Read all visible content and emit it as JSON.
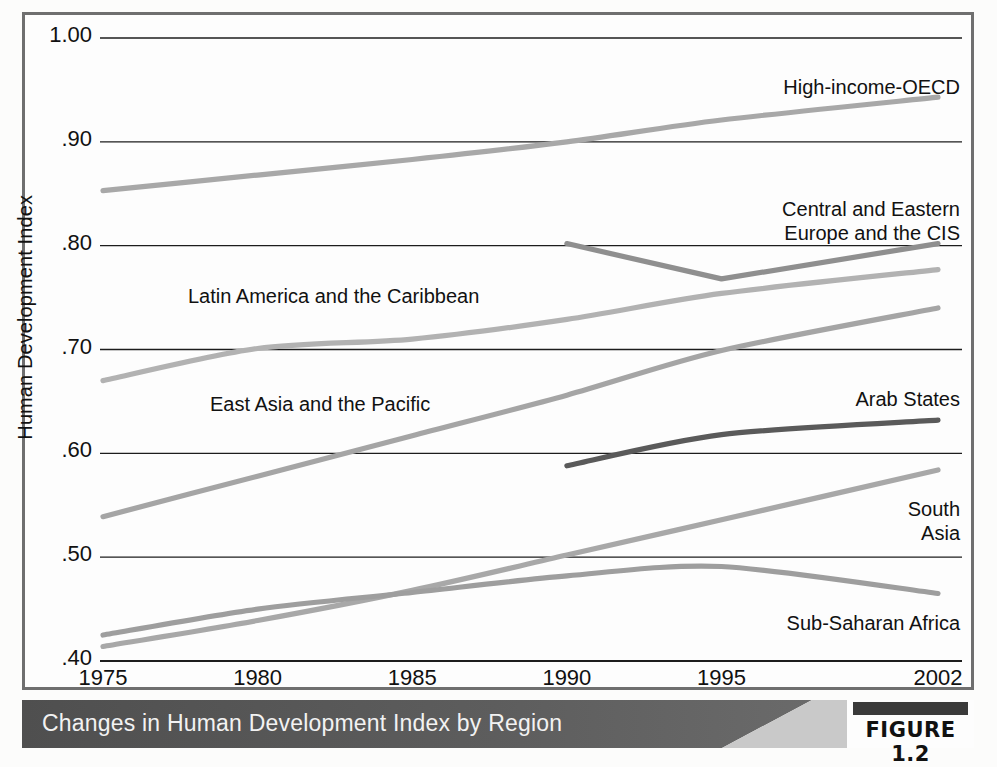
{
  "figure": {
    "caption": "Changes in Human Development Index by Region",
    "badge_label": "FIGURE 1.2"
  },
  "chart_data": {
    "type": "line",
    "title": "Changes in Human Development Index by Region",
    "xlabel": "",
    "ylabel": "Human Development Index",
    "x": [
      1975,
      1980,
      1985,
      1990,
      1995,
      2002
    ],
    "xlim": [
      1975,
      2002
    ],
    "ylim": [
      0.4,
      1.0
    ],
    "ytick_labels": [
      "1.00",
      ".90",
      ".80",
      ".70",
      ".60",
      ".50",
      ".40"
    ],
    "ytick_values": [
      1.0,
      0.9,
      0.8,
      0.7,
      0.6,
      0.5,
      0.4
    ],
    "xtick_labels": [
      "1975",
      "1980",
      "1985",
      "1990",
      "1995",
      "2002"
    ],
    "grid": "horizontal",
    "legend": "inline-labels",
    "series": [
      {
        "name": "High-income-OECD",
        "color": "#a8a8a8",
        "label_anchor": "top-right",
        "x": [
          1975,
          1980,
          1985,
          1990,
          1995,
          2002
        ],
        "values": [
          0.853,
          0.868,
          0.883,
          0.9,
          0.921,
          0.943
        ]
      },
      {
        "name": "Central and Eastern\nEurope and the CIS",
        "color": "#8f8f8f",
        "label_anchor": "right",
        "x": [
          1990,
          1995,
          2002
        ],
        "values": [
          0.802,
          0.768,
          0.802
        ]
      },
      {
        "name": "Latin America and the Caribbean",
        "color": "#b2b2b2",
        "label_anchor": "inline",
        "x": [
          1975,
          1980,
          1985,
          1990,
          1995,
          2002
        ],
        "values": [
          0.67,
          0.701,
          0.71,
          0.729,
          0.754,
          0.777
        ]
      },
      {
        "name": "East Asia and the Pacific",
        "color": "#a5a5a5",
        "label_anchor": "inline",
        "x": [
          1975,
          1980,
          1985,
          1990,
          1995,
          2002
        ],
        "values": [
          0.539,
          0.578,
          0.617,
          0.656,
          0.699,
          0.74
        ]
      },
      {
        "name": "Arab States",
        "color": "#5a5a5a",
        "label_anchor": "right",
        "x": [
          1990,
          1995,
          2002
        ],
        "values": [
          0.588,
          0.618,
          0.632
        ]
      },
      {
        "name": "South\nAsia",
        "color": "#a8a8a8",
        "label_anchor": "right",
        "x": [
          1975,
          1980,
          1985,
          1990,
          1995,
          2002
        ],
        "values": [
          0.414,
          0.439,
          0.468,
          0.502,
          0.536,
          0.584
        ]
      },
      {
        "name": "Sub-Saharan Africa",
        "color": "#9e9e9e",
        "label_anchor": "bottom-right",
        "x": [
          1975,
          1980,
          1985,
          1990,
          1995,
          2002
        ],
        "values": [
          0.425,
          0.45,
          0.466,
          0.482,
          0.491,
          0.465
        ]
      }
    ],
    "series_labels": [
      {
        "text": "High-income-OECD",
        "x": 960,
        "y": 76,
        "align": "right"
      },
      {
        "text": "Central and Eastern",
        "x": 960,
        "y": 198,
        "align": "right"
      },
      {
        "text": "Europe and the CIS",
        "x": 960,
        "y": 222,
        "align": "right"
      },
      {
        "text": "Latin America and the Caribbean",
        "x": 188,
        "y": 285,
        "align": "left"
      },
      {
        "text": "East Asia and the Pacific",
        "x": 210,
        "y": 393,
        "align": "left"
      },
      {
        "text": "Arab States",
        "x": 960,
        "y": 388,
        "align": "right"
      },
      {
        "text": "South",
        "x": 960,
        "y": 498,
        "align": "right"
      },
      {
        "text": "Asia",
        "x": 960,
        "y": 522,
        "align": "right"
      },
      {
        "text": "Sub-Saharan Africa",
        "x": 960,
        "y": 612,
        "align": "right"
      }
    ]
  },
  "axis": {
    "y_title": "Human Development Index",
    "yticks": [
      "1.00",
      ".90",
      ".80",
      ".70",
      ".60",
      ".50",
      ".40"
    ],
    "xticks": [
      "1975",
      "1980",
      "1985",
      "1990",
      "1995",
      "2002"
    ]
  }
}
